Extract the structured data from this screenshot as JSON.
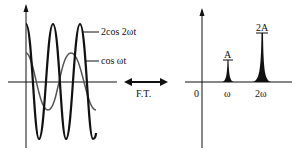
{
  "diagram": {
    "type": "fourier-transform-illustration",
    "time_domain": {
      "curves": [
        {
          "label": "2cos 2ωt",
          "amplitude": 2,
          "frequency": 2,
          "stroke": "#111111",
          "width": 2.2
        },
        {
          "label": "cos ωt",
          "amplitude": 1,
          "frequency": 1,
          "stroke": "#555555",
          "width": 1.5
        }
      ]
    },
    "transform": {
      "label": "F.T.",
      "arrow": "double-headed"
    },
    "frequency_domain": {
      "origin_label": "0",
      "peaks": [
        {
          "x_label": "ω",
          "height_label": "A"
        },
        {
          "x_label": "2ω",
          "height_label": "2A"
        }
      ]
    },
    "colors": {
      "ink": "#111111",
      "secondary": "#555555",
      "background": "#ffffff"
    }
  }
}
